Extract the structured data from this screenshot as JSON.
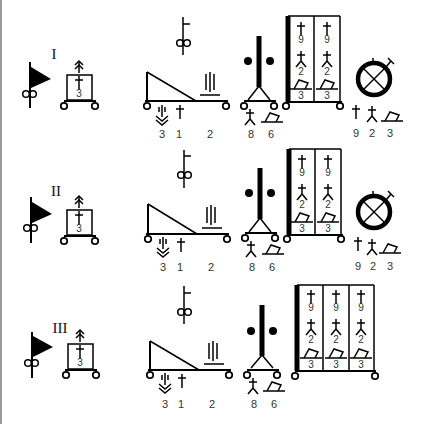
{
  "diagram": {
    "type": "symbolic-lineup-diagram",
    "colors": {
      "ink": "#000000",
      "label": "#333333",
      "background": "#ffffff",
      "edge": "#9a9a9a"
    },
    "rows": [
      {
        "id": "row-1",
        "roman": "I",
        "unit_box": {
          "label": "3"
        },
        "sled": {
          "labels": [
            "3",
            "1",
            "2"
          ]
        },
        "tower": {
          "labels": [
            "8",
            "6"
          ]
        },
        "cabinet": {
          "columns": [
            [
              "9",
              "2",
              "3"
            ],
            [
              "9",
              "2",
              "3"
            ]
          ]
        },
        "dial": {
          "visible": true,
          "labels": [
            "9",
            "2",
            "3"
          ]
        }
      },
      {
        "id": "row-2",
        "roman": "II",
        "unit_box": {
          "label": "3"
        },
        "sled": {
          "labels": [
            "3",
            "1",
            "2"
          ]
        },
        "tower": {
          "labels": [
            "8",
            "6"
          ]
        },
        "cabinet": {
          "columns": [
            [
              "9",
              "2",
              "3"
            ],
            [
              "9",
              "2",
              "3"
            ]
          ]
        },
        "dial": {
          "visible": true,
          "labels": [
            "9",
            "2",
            "3"
          ]
        }
      },
      {
        "id": "row-3",
        "roman": "III",
        "unit_box": {
          "label": "3"
        },
        "sled": {
          "labels": [
            "3",
            "1",
            "2"
          ]
        },
        "tower": {
          "labels": [
            "8",
            "6"
          ]
        },
        "cabinet": {
          "columns": [
            [
              "9",
              "2",
              "3"
            ],
            [
              "9",
              "2",
              "3"
            ],
            [
              "9",
              "2",
              "3"
            ]
          ]
        },
        "dial": {
          "visible": false,
          "labels": []
        }
      }
    ]
  }
}
